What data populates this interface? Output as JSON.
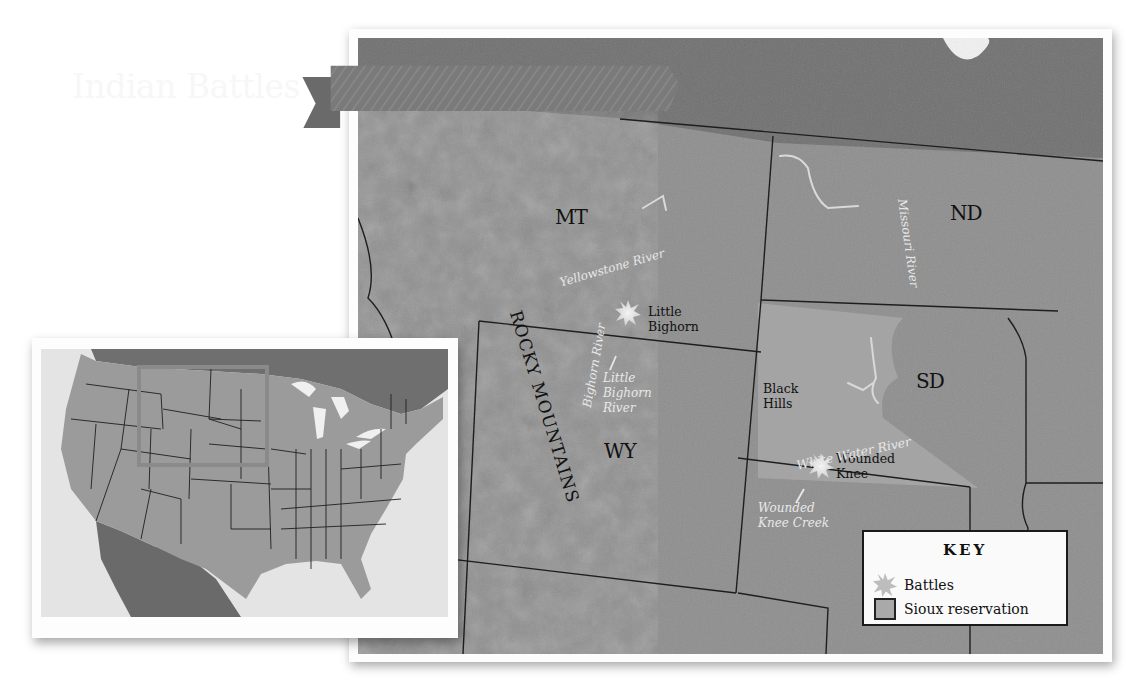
{
  "map": {
    "title": "Indian Battles",
    "states": [
      {
        "abbr": "MT",
        "x": 197,
        "y": 170
      },
      {
        "abbr": "ND",
        "x": 592,
        "y": 166
      },
      {
        "abbr": "SD",
        "x": 558,
        "y": 334
      },
      {
        "abbr": "WY",
        "x": 246,
        "y": 404
      }
    ],
    "places": {
      "little_bighorn": "Little\nBighorn",
      "black_hills": "Black\nHills",
      "wounded_knee": "Wounded\nKnee"
    },
    "rivers": {
      "yellowstone": "Yellowstone River",
      "missouri": "Missouri River",
      "bighorn": "Bighorn River",
      "little_bighorn_river": "Little\nBighorn\nRiver",
      "white_water": "White Water River",
      "wounded_knee_creek": "Wounded\nKnee Creek"
    },
    "mountains": "ROCKY MOUNTAINS",
    "colors": {
      "canada": "#6f6f6f",
      "land": "#8f8f8f",
      "reservation": "#a9a9a9",
      "battle_star": "#e6e6e6",
      "banner": "#7d7d7d"
    }
  },
  "key": {
    "title": "KEY",
    "items": [
      {
        "symbol": "battle-star",
        "label": "Battles"
      },
      {
        "symbol": "reservation-swatch",
        "label": "Sioux reservation"
      }
    ]
  },
  "inset": {
    "description": "Locator map of the contiguous United States with highlighted region",
    "highlight_color": "#8a8a8a"
  }
}
